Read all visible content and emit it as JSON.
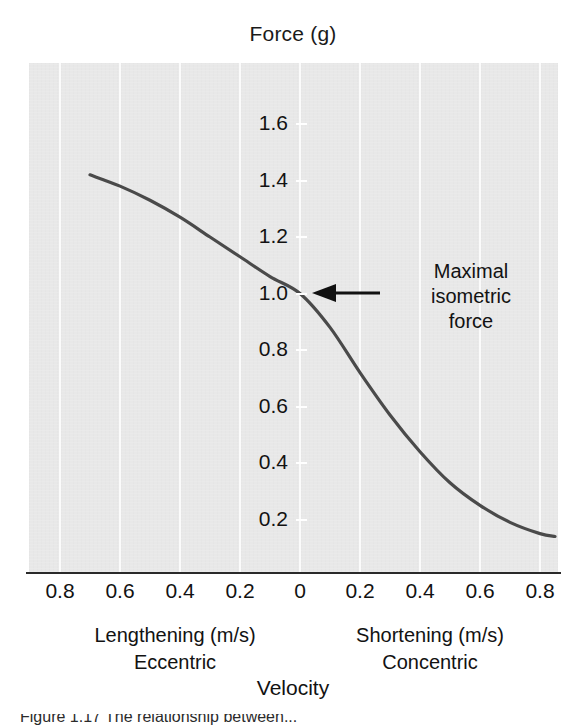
{
  "figure": {
    "top_axis_title": "Force (g)",
    "bottom_axis_title": "Velocity",
    "caption_fragment": "Figure 1.17   The relationship between..."
  },
  "annotation": {
    "line1": "Maximal",
    "line2": "isometric",
    "line3": "force",
    "arrow_icon": "arrow-left-icon"
  },
  "side_labels": {
    "left_line1": "Lengthening (m/s)",
    "left_line2": "Eccentric",
    "right_line1": "Shortening (m/s)",
    "right_line2": "Concentric"
  },
  "colors": {
    "plot_background": "#e8e8e8",
    "gridline": "#fbfbfb",
    "curve": "#4a4a4a",
    "axis": "#2a2a2a",
    "text": "#121212"
  },
  "chart_data": {
    "type": "line",
    "title": "Force (g)",
    "xlabel": "Velocity",
    "ylabel": "Force (g)",
    "xlim": [
      -0.9,
      0.9
    ],
    "ylim": [
      0.0,
      1.8
    ],
    "grid": true,
    "legend": "none",
    "x_tick_values": [
      -0.8,
      -0.6,
      -0.4,
      -0.2,
      0,
      0.2,
      0.4,
      0.6,
      0.8
    ],
    "x_tick_labels": [
      "0.8",
      "0.6",
      "0.4",
      "0.2",
      "0",
      "0.2",
      "0.4",
      "0.6",
      "0.8"
    ],
    "y_tick_values": [
      1.6,
      1.4,
      1.2,
      1.0,
      0.8,
      0.6,
      0.4,
      0.2
    ],
    "y_tick_labels": [
      "1.6",
      "1.4",
      "1.2",
      "1.0",
      "0.8",
      "0.6",
      "0.4",
      "0.2"
    ],
    "x_axis_regions": [
      {
        "name": "Lengthening (m/s) / Eccentric",
        "range": [
          -0.9,
          0
        ]
      },
      {
        "name": "Shortening (m/s) / Concentric",
        "range": [
          0,
          0.9
        ]
      }
    ],
    "series": [
      {
        "name": "Force-velocity relationship",
        "color": "#4a4a4a",
        "x": [
          -0.7,
          -0.6,
          -0.5,
          -0.4,
          -0.3,
          -0.2,
          -0.1,
          0.0,
          0.1,
          0.2,
          0.3,
          0.4,
          0.5,
          0.6,
          0.7,
          0.8,
          0.85
        ],
        "y": [
          1.42,
          1.38,
          1.33,
          1.27,
          1.2,
          1.13,
          1.06,
          1.0,
          0.88,
          0.72,
          0.57,
          0.44,
          0.33,
          0.25,
          0.19,
          0.15,
          0.14
        ]
      }
    ],
    "annotations": [
      {
        "text": "Maximal isometric force",
        "points_to_x": 0.0,
        "points_to_y": 1.0,
        "arrow": "left"
      }
    ]
  }
}
